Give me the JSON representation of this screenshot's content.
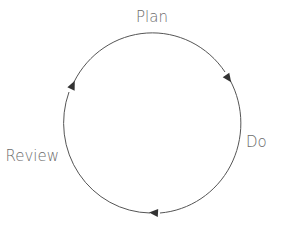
{
  "diagram": {
    "type": "cycle",
    "direction": "clockwise",
    "stroke_color": "#555555",
    "label_color": "#6b6b6b",
    "stages": [
      {
        "label": "Plan",
        "position": "top"
      },
      {
        "label": "Do",
        "position": "right"
      },
      {
        "label": "Review",
        "position": "left"
      }
    ]
  }
}
